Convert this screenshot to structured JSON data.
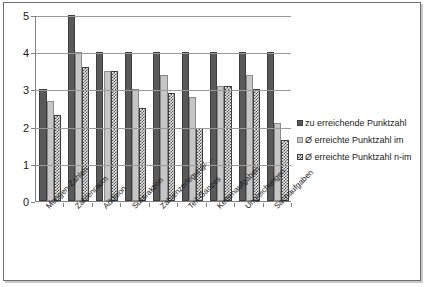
{
  "chart_data": {
    "type": "bar",
    "title": "",
    "xlabel": "",
    "ylabel": "",
    "ylim": [
      0,
      5
    ],
    "yticks": [
      0,
      1,
      2,
      3,
      4,
      5
    ],
    "grid": true,
    "legend_position": "right",
    "categories": [
      "Mengen-Zahlen",
      "Zahlenraum",
      "Addition",
      "Subtraktion",
      "Zahlenzerlegung/-...",
      "Teil-Ganzes",
      "Kettenaufgaben",
      "Ungleichungen",
      "Sachaufgaben"
    ],
    "series": [
      {
        "name": "zu erreichende Punktzahl",
        "color": "#595959",
        "pattern": "solid",
        "values": [
          3.0,
          5.0,
          4.0,
          4.0,
          4.0,
          4.0,
          4.0,
          4.0,
          4.0
        ]
      },
      {
        "name": "Ø erreichte Punktzahl im",
        "color": "#c6c6c6",
        "pattern": "solid-light",
        "values": [
          2.7,
          4.0,
          3.5,
          3.0,
          3.4,
          2.8,
          3.1,
          3.4,
          2.1
        ]
      },
      {
        "name": "Ø erreichte Punktzahl n-im",
        "color": "#4a4a4a",
        "pattern": "checkered",
        "values": [
          2.3,
          3.6,
          3.5,
          2.5,
          2.9,
          1.95,
          3.1,
          3.0,
          1.65
        ]
      }
    ]
  },
  "legend": {
    "items": [
      {
        "label": "zu erreichende Punktzahl"
      },
      {
        "label": "Ø erreichte Punktzahl im"
      },
      {
        "label": "Ø erreichte Punktzahl n-im"
      }
    ]
  }
}
